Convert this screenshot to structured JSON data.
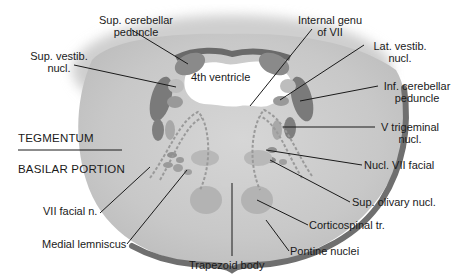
{
  "diagram": {
    "colors": {
      "background": "#ffffff",
      "tissue": "#c9c9c9",
      "tissue_light": "#d8d8d8",
      "rim": "#707070",
      "nucleus_dark": "#7a7a7a",
      "nucleus_mid": "#999999",
      "nucleus_light": "#b5b5b5",
      "ventricle": "#ffffff",
      "leader_line": "#1a1a1a",
      "text": "#1a1a1a"
    },
    "center_label": "4th ventricle",
    "regions": {
      "tegmentum": "TEGMENTUM",
      "basilar": "BASILAR PORTION"
    },
    "labels_left": [
      {
        "id": "sup-cerebellar-peduncle",
        "line1": "Sup. cerebellar",
        "line2": "peduncle"
      },
      {
        "id": "sup-vestib-nucl",
        "line1": "Sup. vestib.",
        "line2": "nucl."
      },
      {
        "id": "vii-facial-n",
        "line1": "VII facial n."
      },
      {
        "id": "medial-lemniscus",
        "line1": "Medial lemniscus"
      }
    ],
    "labels_right": [
      {
        "id": "internal-genu-vii",
        "line1": "Internal genu",
        "line2": "of VII"
      },
      {
        "id": "lat-vestib-nucl",
        "line1": "Lat. vestib.",
        "line2": "nucl."
      },
      {
        "id": "inf-cerebellar-peduncle",
        "line1": "Inf. cerebellar",
        "line2": "peduncle"
      },
      {
        "id": "v-trigeminal-nucl",
        "line1": "V trigeminal",
        "line2": "nucl."
      },
      {
        "id": "nucl-vii-facial",
        "line1": "Nucl. VII facial"
      },
      {
        "id": "sup-olivary-nucl",
        "line1": "Sup. olivary nucl."
      },
      {
        "id": "corticospinal-tr",
        "line1": "Corticospinal tr."
      },
      {
        "id": "pontine-nuclei",
        "line1": "Pontine nuclei"
      }
    ],
    "labels_bottom": [
      {
        "id": "trapezoid-body",
        "line1": "Trapezoid body"
      }
    ]
  }
}
